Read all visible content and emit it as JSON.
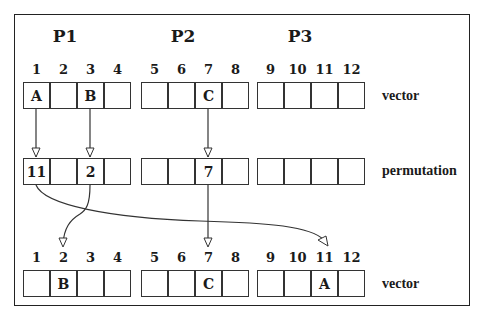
{
  "processors": [
    {
      "label": "P1",
      "x": 52
    },
    {
      "label": "P2",
      "x": 170
    },
    {
      "label": "P3",
      "x": 287
    }
  ],
  "groups_x": [
    23,
    141,
    257
  ],
  "cell_width": 27,
  "rows": {
    "top_vector": {
      "label": "vector",
      "y": 82,
      "index_y": 62,
      "indices": [
        "1",
        "2",
        "3",
        "4",
        "5",
        "6",
        "7",
        "8",
        "9",
        "10",
        "11",
        "12"
      ],
      "cells": [
        "A",
        "",
        "B",
        "",
        "",
        "",
        "C",
        "",
        "",
        "",
        "",
        ""
      ]
    },
    "permutation": {
      "label": "permutation",
      "y": 158,
      "cells": [
        "11",
        "",
        "2",
        "",
        "",
        "",
        "7",
        "",
        "",
        "",
        "",
        ""
      ]
    },
    "bottom_vector": {
      "label": "vector",
      "y": 270,
      "index_y": 250,
      "indices": [
        "1",
        "2",
        "3",
        "4",
        "5",
        "6",
        "7",
        "8",
        "9",
        "10",
        "11",
        "12"
      ],
      "cells": [
        "",
        "B",
        "",
        "",
        "",
        "",
        "C",
        "",
        "",
        "",
        "A",
        ""
      ]
    }
  },
  "arrows": [
    {
      "from": "top_vector.1",
      "to": "permutation.1"
    },
    {
      "from": "top_vector.3",
      "to": "permutation.3"
    },
    {
      "from": "top_vector.7",
      "to": "permutation.7"
    },
    {
      "from": "permutation.1",
      "to": "bottom_vector.11",
      "value": "11"
    },
    {
      "from": "permutation.3",
      "to": "bottom_vector.2",
      "value": "2"
    },
    {
      "from": "permutation.7",
      "to": "bottom_vector.7",
      "value": "7"
    }
  ],
  "colors": {
    "line": "#333333",
    "text": "#1a1a1a",
    "background": "#ffffff"
  }
}
